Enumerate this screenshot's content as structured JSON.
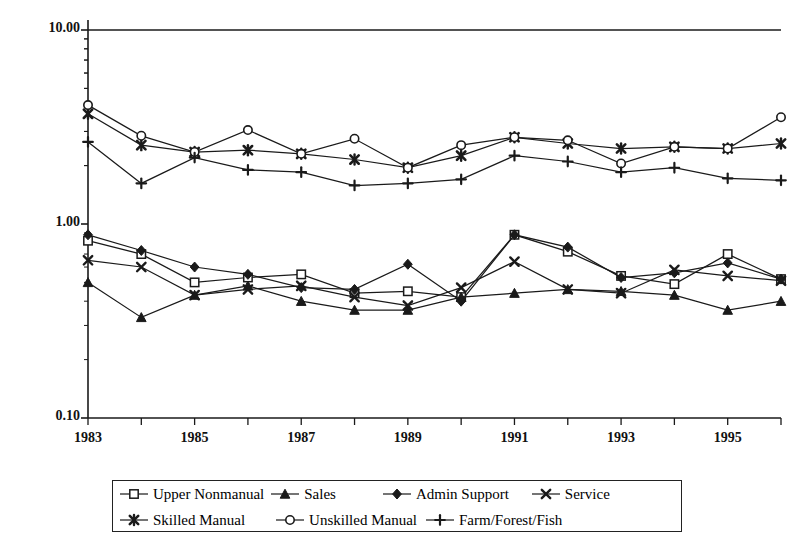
{
  "chart_data": {
    "type": "line",
    "title": "",
    "subtitle": "",
    "xlabel": "",
    "ylabel": "",
    "yscale": "log",
    "ylim": [
      0.1,
      10.0
    ],
    "ytick_labels": [
      "10.00",
      "1.00",
      "0.10"
    ],
    "ytick_values": [
      10.0,
      1.0,
      0.1
    ],
    "grid": false,
    "legend_position": "bottom",
    "x": [
      1983,
      1984,
      1985,
      1986,
      1987,
      1988,
      1989,
      1990,
      1991,
      1992,
      1993,
      1994,
      1995,
      1996
    ],
    "xtick_labels": [
      "1983",
      "1985",
      "1987",
      "1989",
      "1991",
      "1993",
      "1995"
    ],
    "xtick_values": [
      1983,
      1985,
      1987,
      1989,
      1991,
      1993,
      1995
    ],
    "series": [
      {
        "name": "Upper Nonmanual",
        "marker": "open-square",
        "values": [
          0.82,
          0.7,
          0.5,
          0.53,
          0.55,
          0.44,
          0.45,
          0.42,
          0.88,
          0.72,
          0.54,
          0.49,
          0.7,
          0.52
        ]
      },
      {
        "name": "Sales",
        "marker": "filled-triangle",
        "values": [
          0.5,
          0.33,
          0.43,
          0.48,
          0.4,
          0.36,
          0.36,
          0.42,
          0.44,
          0.46,
          0.45,
          0.43,
          0.36,
          0.4
        ]
      },
      {
        "name": "Admin Support",
        "marker": "filled-diamond",
        "values": [
          0.88,
          0.73,
          0.6,
          0.55,
          0.47,
          0.46,
          0.62,
          0.4,
          0.88,
          0.76,
          0.53,
          0.56,
          0.63,
          0.52
        ]
      },
      {
        "name": "Service",
        "marker": "filled-x",
        "values": [
          0.65,
          0.6,
          0.43,
          0.46,
          0.48,
          0.42,
          0.38,
          0.47,
          0.64,
          0.46,
          0.44,
          0.58,
          0.54,
          0.51
        ]
      },
      {
        "name": "Skilled Manual",
        "marker": "filled-star-x",
        "values": [
          3.7,
          2.55,
          2.35,
          2.4,
          2.3,
          2.15,
          1.95,
          2.25,
          2.8,
          2.6,
          2.45,
          2.5,
          2.45,
          2.6
        ]
      },
      {
        "name": "Unskilled Manual",
        "marker": "open-circle",
        "values": [
          4.1,
          2.85,
          2.35,
          3.05,
          2.3,
          2.75,
          1.95,
          2.55,
          2.8,
          2.7,
          2.05,
          2.5,
          2.45,
          3.55
        ]
      },
      {
        "name": "Farm/Forest/Fish",
        "marker": "plus",
        "values": [
          2.65,
          1.62,
          2.2,
          1.9,
          1.85,
          1.58,
          1.62,
          1.7,
          2.25,
          2.1,
          1.85,
          1.95,
          1.72,
          1.68
        ]
      }
    ]
  },
  "axis": {
    "y_labels": [
      "10.00",
      "1.00",
      "0.10"
    ],
    "x_labels": [
      "1983",
      "1985",
      "1987",
      "1989",
      "1991",
      "1993",
      "1995"
    ]
  },
  "legend": {
    "row1": [
      {
        "label": "Upper Nonmanual",
        "marker": "open-square"
      },
      {
        "label": "Sales",
        "marker": "filled-triangle"
      },
      {
        "label": "Admin Support",
        "marker": "filled-diamond"
      },
      {
        "label": "Service",
        "marker": "filled-x"
      }
    ],
    "row2": [
      {
        "label": "Skilled Manual",
        "marker": "filled-star-x"
      },
      {
        "label": "Unskilled Manual",
        "marker": "open-circle"
      },
      {
        "label": "Farm/Forest/Fish",
        "marker": "plus"
      }
    ]
  },
  "colors": {
    "line": "#1a1a1a",
    "axis": "#1a1a1a",
    "background": "#ffffff"
  }
}
